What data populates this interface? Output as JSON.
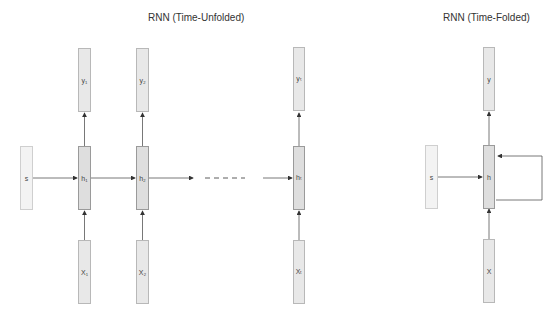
{
  "unfolded": {
    "title": "RNN (Time-Unfolded)",
    "state_label": "s",
    "steps": [
      {
        "output": "y₁",
        "hidden": "h₁",
        "input": "X₁"
      },
      {
        "output": "y₂",
        "hidden": "h₂",
        "input": "X₂"
      },
      {
        "output": "yₜ",
        "hidden": "hₜ",
        "input": "Xₜ"
      }
    ],
    "ellipsis": "- - - - - -"
  },
  "folded": {
    "title": "RNN (Time-Folded)",
    "state_label": "s",
    "output": "y",
    "hidden": "h",
    "input": "X"
  },
  "colors": {
    "box_fill": "#e8e8e8",
    "box_border": "#b8b8b8",
    "arrow": "#333333"
  }
}
